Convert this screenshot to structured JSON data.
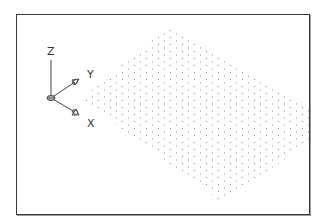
{
  "viewport": {
    "type": "isometric-grid-drawing",
    "grid": {
      "style": "dotted",
      "dot_color": "#8a8a8a",
      "spacing_x": 6,
      "spacing_y": 3.5,
      "polygon": [
        [
          168,
          25
        ],
        [
          308,
          110
        ],
        [
          308,
          140
        ],
        [
          220,
          200
        ],
        [
          80,
          98
        ]
      ]
    },
    "ucs_icon": {
      "axes": [
        {
          "name": "z",
          "label": "Z"
        },
        {
          "name": "y",
          "label": "Y"
        },
        {
          "name": "x",
          "label": "X"
        }
      ],
      "colors": {
        "line": "#444444"
      }
    }
  }
}
